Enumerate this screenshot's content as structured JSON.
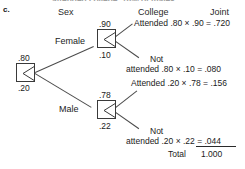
{
  "part_label": "c.",
  "running_head_fragment": "attended college, 78% of males",
  "headers": {
    "sex": "Sex",
    "college": "College",
    "joint": "Joint"
  },
  "branch_labels": {
    "female": "Female",
    "male": "Male"
  },
  "probabilities": {
    "female": ".80",
    "male": ".20",
    "female_attended": ".90",
    "female_not_attended": ".10",
    "male_attended": ".78",
    "male_not_attended": ".22"
  },
  "outcomes": [
    {
      "id": "female-attended",
      "label": "Attended",
      "label_line2": "",
      "expression": ".80  ×  .90  =  .720",
      "p1": ".80",
      "p2": ".90",
      "joint": ".720"
    },
    {
      "id": "female-not-attended",
      "label": "Not",
      "label_line2": "attended",
      "expression": ".80  ×  .10  =  .080",
      "p1": ".80",
      "p2": ".10",
      "joint": ".080"
    },
    {
      "id": "male-attended",
      "label": "Attended",
      "label_line2": "",
      "expression": ".20  ×  .78  =  .156",
      "p1": ".20",
      "p2": ".78",
      "joint": ".156"
    },
    {
      "id": "male-not-attended",
      "label": "Not",
      "label_line2": "attended",
      "expression": ".20  ×  .22  =  .044",
      "p1": ".20",
      "p2": ".22",
      "joint": ".044"
    }
  ],
  "total": {
    "label": "Total",
    "value": "1.000"
  },
  "colors": {
    "ink": "#1b1b1b",
    "line": "#4a4a4a",
    "background": "#ffffff"
  }
}
